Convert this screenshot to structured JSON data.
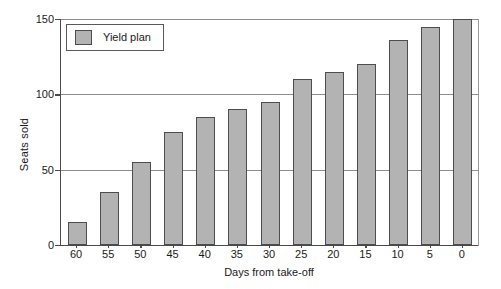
{
  "chart_data": {
    "type": "bar",
    "title": "",
    "xlabel": "Days from take-off",
    "ylabel": "Seats sold",
    "categories": [
      "60",
      "55",
      "50",
      "45",
      "40",
      "35",
      "30",
      "25",
      "20",
      "15",
      "10",
      "5",
      "0"
    ],
    "values": [
      15,
      35,
      55,
      75,
      85,
      90,
      95,
      110,
      115,
      120,
      136,
      145,
      150
    ],
    "series": [
      {
        "name": "Yield plan",
        "values": [
          15,
          35,
          55,
          75,
          85,
          90,
          95,
          110,
          115,
          120,
          136,
          145,
          150
        ]
      }
    ],
    "ylim": [
      0,
      150
    ],
    "yticks": [
      0,
      50,
      100,
      150
    ],
    "ytick_labels": [
      "0",
      "50",
      "100",
      "150"
    ],
    "grid": true,
    "legend": {
      "position": "top-left",
      "entries": [
        "Yield plan"
      ]
    },
    "colors": {
      "bar_fill": "#b3b3b3",
      "bar_border": "#4d4d4d",
      "gridline": "#8d8d8d",
      "axis": "#4a4a4a",
      "background": "#ffffff",
      "text": "#1a1a1a"
    }
  }
}
